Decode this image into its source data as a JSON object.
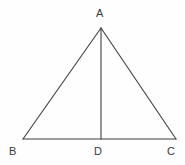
{
  "figure": {
    "kind": "isosceles-triangle-with-altitude",
    "background_color": "#fefefe",
    "stroke_color": "#3f3f3f",
    "stroke_width": 1.1,
    "label_color": "#3a3a3a",
    "canvas": {
      "width": 185,
      "height": 165
    },
    "points": {
      "A": {
        "x": 101,
        "y": 28,
        "label": "A"
      },
      "B": {
        "x": 23,
        "y": 139,
        "label": "B"
      },
      "C": {
        "x": 176,
        "y": 139,
        "label": "C"
      },
      "D": {
        "x": 101,
        "y": 139,
        "label": "D"
      }
    },
    "segments": [
      {
        "name": "AB",
        "from": "A",
        "to": "B"
      },
      {
        "name": "AC",
        "from": "A",
        "to": "C"
      },
      {
        "name": "BC",
        "from": "B",
        "to": "C"
      },
      {
        "name": "AD",
        "from": "A",
        "to": "D"
      }
    ],
    "labels": {
      "apex": "A",
      "base_left": "B",
      "base_mid": "D",
      "base_right": "C"
    }
  }
}
